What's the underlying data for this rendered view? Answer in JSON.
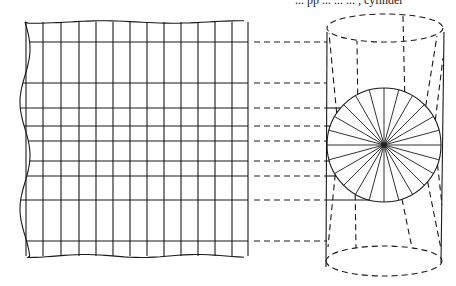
{
  "caption_fragment": "... pp ... ... ... , cylinder",
  "diagram": {
    "colors": {
      "ink": "#1a1a1a",
      "background": "#ffffff"
    },
    "grid": {
      "left_wavy_x": 20,
      "right_x": 248,
      "top_y": 22,
      "bottom_y": 256,
      "vertical_lines_x": [
        26,
        43,
        61,
        79,
        96,
        113,
        130,
        147,
        164,
        181,
        198,
        215,
        232
      ],
      "horizontal_lines_y": [
        42,
        83,
        108,
        126,
        141,
        161,
        176,
        200,
        241
      ]
    },
    "projection_lines": {
      "style": "dashed",
      "from_x": 250,
      "to_x": 327,
      "y": [
        42,
        83,
        108,
        126,
        141,
        161,
        176,
        200,
        241
      ]
    },
    "cylinder": {
      "left_x": 327,
      "right_x": 441,
      "top_ellipse": {
        "cx": 385,
        "cy": 28,
        "rx": 58,
        "ry": 14
      },
      "bottom_ellipse": {
        "cx": 384,
        "cy": 261,
        "rx": 58,
        "ry": 15
      },
      "circle": {
        "cx": 384,
        "cy": 145,
        "r": 57
      },
      "spoke_count": 24
    }
  }
}
